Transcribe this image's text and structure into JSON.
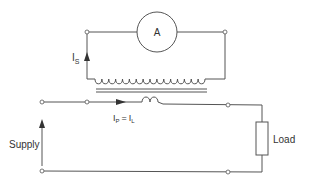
{
  "diagram": {
    "ammeter": {
      "label": "A"
    },
    "secondary_current": {
      "main": "I",
      "sub": "S"
    },
    "primary_current": {
      "lhs_main": "I",
      "lhs_sub": "P",
      "eq": "=",
      "rhs_main": "I",
      "rhs_sub": "L"
    },
    "supply_label": "Supply",
    "load_label": "Load",
    "secondary_coil_turns": 16,
    "primary_coil_turns": 2,
    "colors": {
      "wire": "#555555",
      "text": "#333333",
      "background": "#ffffff"
    }
  }
}
